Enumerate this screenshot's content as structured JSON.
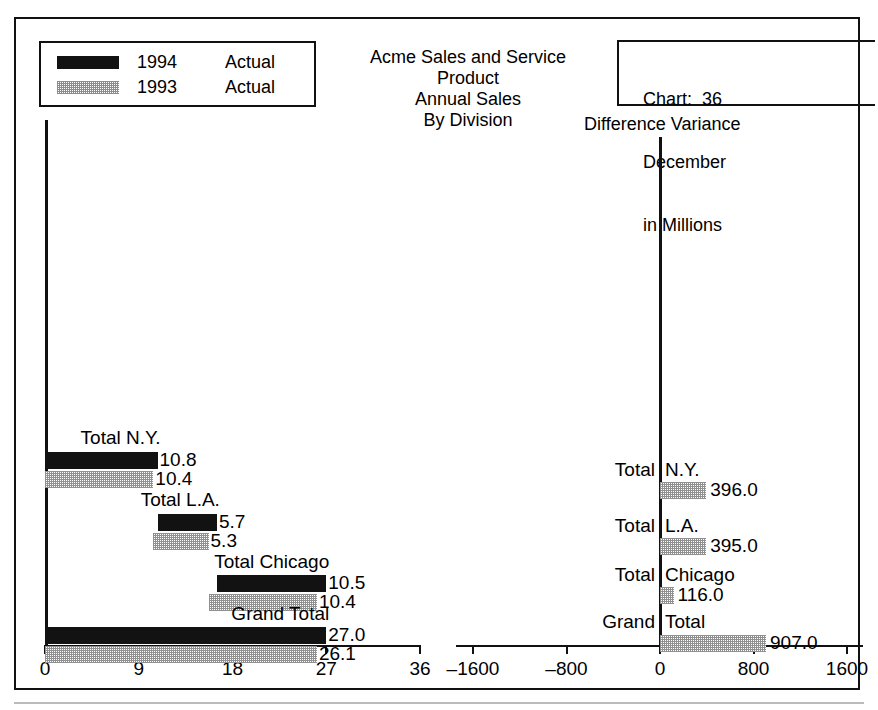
{
  "legend": {
    "rows": [
      {
        "year": "1994",
        "kind": "Actual",
        "swatch": "black-swatch"
      },
      {
        "year": "1993",
        "kind": "Actual",
        "swatch": "gray-swatch"
      }
    ]
  },
  "title": {
    "line1": "Acme Sales and Service",
    "line2": "Product",
    "line3": "Annual Sales",
    "line4": "By Division"
  },
  "chart_info": {
    "chart_label": "Chart:  36",
    "period": "December",
    "units": "in Millions"
  },
  "right_panel": {
    "title": "Difference Variance"
  },
  "chart_data": [
    {
      "type": "bar",
      "title": "Acme Sales and Service Product Annual Sales By Division",
      "subtitle": "in Millions",
      "orientation": "horizontal",
      "layout": "cascade",
      "xlabel": "",
      "ylabel": "",
      "xlim": [
        0,
        36
      ],
      "xticks": [
        0,
        9,
        18,
        27,
        36
      ],
      "xticklabels": [
        "0",
        "9",
        "18",
        "27",
        "36"
      ],
      "grid": false,
      "legend": [
        "1994 Actual",
        "1993 Actual"
      ],
      "categories": [
        "Total N.Y.",
        "Total L.A.",
        "Total Chicago",
        "Grand Total"
      ],
      "series": [
        {
          "name": "1994 Actual",
          "values": [
            10.8,
            5.7,
            10.5,
            27.0
          ],
          "starts": [
            0,
            10.8,
            16.5,
            0
          ],
          "color": "#121212"
        },
        {
          "name": "1993 Actual",
          "values": [
            10.4,
            5.3,
            10.4,
            26.1
          ],
          "starts": [
            0,
            10.4,
            15.7,
            0
          ],
          "color": "#909090"
        }
      ],
      "labels": {
        "1994 Actual": [
          "10.8",
          "5.7",
          "10.5",
          "27.0"
        ],
        "1993 Actual": [
          "10.4",
          "5.3",
          "10.4",
          "26.1"
        ]
      }
    },
    {
      "type": "bar",
      "title": "Difference Variance",
      "orientation": "horizontal",
      "xlabel": "",
      "ylabel": "",
      "xlim": [
        -1600,
        1600
      ],
      "xticks": [
        -1600,
        -800,
        0,
        800,
        1600
      ],
      "xticklabels": [
        "–1600",
        "–800",
        "0",
        "800",
        "1600"
      ],
      "grid": false,
      "categories": [
        "Total N.Y.",
        "Total L.A.",
        "Total Chicago",
        "Grand Total"
      ],
      "series": [
        {
          "name": "Difference Variance",
          "values": [
            396.0,
            395.0,
            116.0,
            907.0
          ],
          "color": "#909090"
        }
      ],
      "labels": {
        "Difference Variance": [
          "396.0",
          "395.0",
          "116.0",
          "907.0"
        ]
      }
    }
  ],
  "left_rows": [
    {
      "label": "Total N.Y.",
      "v94": "10.8",
      "v93": "10.4"
    },
    {
      "label": "Total L.A.",
      "v94": "5.7",
      "v93": "5.3"
    },
    {
      "label": "Total Chicago",
      "v94": "10.5",
      "v93": "10.4"
    },
    {
      "label": "Grand Total",
      "v94": "27.0",
      "v93": "26.1"
    }
  ],
  "right_rows": [
    {
      "label_left": "Total",
      "label_right": "N.Y.",
      "value": "396.0"
    },
    {
      "label_left": "Total",
      "label_right": "L.A.",
      "value": "395.0"
    },
    {
      "label_left": "Total",
      "label_right": "Chicago",
      "value": "116.0"
    },
    {
      "label_left": "Grand",
      "label_right": "Total",
      "value": "907.0"
    }
  ],
  "left_axis": {
    "ticklabels": [
      "0",
      "9",
      "18",
      "27",
      "36"
    ]
  },
  "right_axis": {
    "ticklabels": [
      "–1600",
      "–800",
      "0",
      "800",
      "1600"
    ]
  }
}
